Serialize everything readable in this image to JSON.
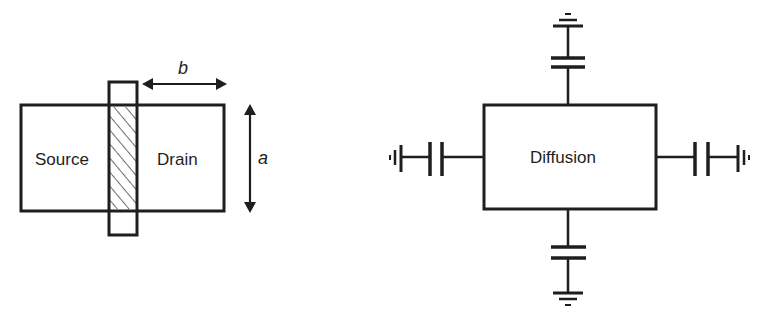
{
  "mosfet_layout": {
    "source_label": "Source",
    "drain_label": "Drain",
    "dimension_a": "a",
    "dimension_b": "b",
    "gate_hatch": "diagonal hatch (channel region)"
  },
  "diffusion_model": {
    "box_label": "Diffusion",
    "terminals": [
      {
        "side": "top",
        "element": "capacitor-to-ground"
      },
      {
        "side": "right",
        "element": "capacitor-to-ground"
      },
      {
        "side": "bottom",
        "element": "capacitor-to-ground"
      },
      {
        "side": "left",
        "element": "capacitor-to-ground"
      }
    ]
  },
  "colors": {
    "ink": "#1e1e1e",
    "background": "#ffffff"
  }
}
